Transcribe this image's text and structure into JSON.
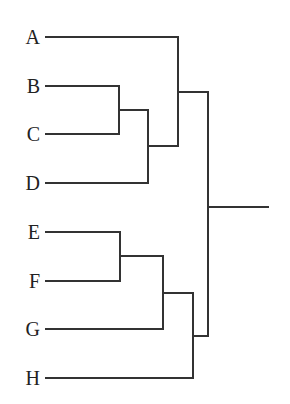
{
  "diagram": {
    "type": "dendrogram",
    "orientation": "leaves-left, root-right",
    "line_color": "#333333",
    "leaves": [
      {
        "label": "A",
        "y": 37
      },
      {
        "label": "B",
        "y": 86
      },
      {
        "label": "C",
        "y": 134
      },
      {
        "label": "D",
        "y": 183
      },
      {
        "label": "E",
        "y": 232
      },
      {
        "label": "F",
        "y": 281
      },
      {
        "label": "G",
        "y": 329
      },
      {
        "label": "H",
        "y": 378
      }
    ],
    "clusters": [
      {
        "id": "BC",
        "children": [
          "B",
          "C"
        ]
      },
      {
        "id": "BCD",
        "children": [
          "BC",
          "D"
        ]
      },
      {
        "id": "ABCD",
        "children": [
          "A",
          "BCD"
        ]
      },
      {
        "id": "EF",
        "children": [
          "E",
          "F"
        ]
      },
      {
        "id": "EFG",
        "children": [
          "EF",
          "G"
        ]
      },
      {
        "id": "EFGH",
        "children": [
          "EFG",
          "H"
        ]
      },
      {
        "id": "root",
        "children": [
          "ABCD",
          "EFGH"
        ]
      }
    ]
  }
}
